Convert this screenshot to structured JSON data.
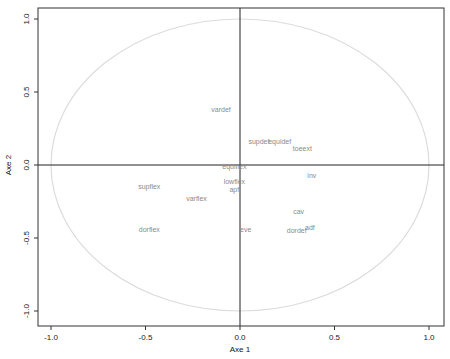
{
  "chart_data": {
    "type": "scatter",
    "title": "",
    "xlabel": "Axe 1",
    "ylabel": "Axe 2",
    "xlim": [
      -1.08,
      1.08
    ],
    "ylim": [
      -1.1,
      1.08
    ],
    "grid": false,
    "legend": null,
    "x_ticks": [
      -1.0,
      -0.5,
      0.0,
      0.5,
      1.0
    ],
    "x_tick_labels": [
      "-1.0",
      "-0.5",
      "0.0",
      "0.5",
      "1.0"
    ],
    "y_ticks": [
      -1.0,
      -0.5,
      0.0,
      0.5,
      1.0
    ],
    "y_tick_labels": [
      "-1.0",
      "-0.5",
      "0.0",
      "0.5",
      "1.0"
    ],
    "annotations": [
      "correlation circle (radius 1)",
      "reference lines at x=0 and y=0"
    ],
    "points": [
      {
        "label": "vardef",
        "x": -0.1,
        "y": 0.38
      },
      {
        "label": "supdef",
        "x": 0.1,
        "y": 0.16
      },
      {
        "label": "equidef",
        "x": 0.21,
        "y": 0.16
      },
      {
        "label": "toeext",
        "x": 0.33,
        "y": 0.11
      },
      {
        "label": "equiflex",
        "x": -0.03,
        "y": -0.01
      },
      {
        "label": "inv",
        "x": 0.38,
        "y": -0.07
      },
      {
        "label": "lowflex",
        "x": -0.03,
        "y": -0.11
      },
      {
        "label": "apf",
        "x": -0.03,
        "y": -0.17
      },
      {
        "label": "supflex",
        "x": -0.48,
        "y": -0.15
      },
      {
        "label": "varflex",
        "x": -0.23,
        "y": -0.23
      },
      {
        "label": "cav",
        "x": 0.31,
        "y": -0.32
      },
      {
        "label": "dorflex",
        "x": -0.48,
        "y": -0.44
      },
      {
        "label": "eve",
        "x": 0.03,
        "y": -0.44
      },
      {
        "label": "dordef",
        "x": 0.3,
        "y": -0.45
      },
      {
        "label": "adf",
        "x": 0.37,
        "y": -0.43
      }
    ]
  },
  "colors": {
    "frame": "#333333",
    "ref_lines": "#222222",
    "circle": "#dcdcdc",
    "point_labels": "#8a8a8a"
  }
}
